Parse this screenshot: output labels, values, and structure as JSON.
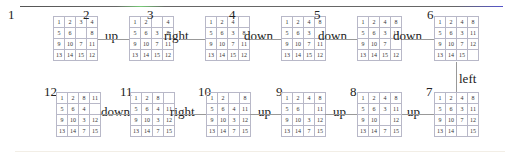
{
  "states": [
    {
      "id": "1",
      "grid": [
        [
          "1",
          "2",
          "3",
          "4"
        ],
        [
          "5",
          "6",
          "",
          "8"
        ],
        [
          "9",
          "10",
          "7",
          "11"
        ],
        [
          "13",
          "14",
          "15",
          "12"
        ]
      ]
    },
    {
      "id": "2",
      "grid": [
        [
          "1",
          "2",
          "",
          "4"
        ],
        [
          "5",
          "6",
          "3",
          "8"
        ],
        [
          "9",
          "10",
          "7",
          "11"
        ],
        [
          "13",
          "14",
          "15",
          "12"
        ]
      ]
    },
    {
      "id": "3",
      "grid": [
        [
          "1",
          "2",
          "4",
          ""
        ],
        [
          "5",
          "6",
          "3",
          "8"
        ],
        [
          "9",
          "10",
          "7",
          "11"
        ],
        [
          "13",
          "14",
          "15",
          "12"
        ]
      ]
    },
    {
      "id": "4",
      "grid": [
        [
          "1",
          "2",
          "4",
          "8"
        ],
        [
          "5",
          "6",
          "3",
          ""
        ],
        [
          "9",
          "10",
          "7",
          "11"
        ],
        [
          "13",
          "14",
          "15",
          "12"
        ]
      ]
    },
    {
      "id": "5",
      "grid": [
        [
          "1",
          "2",
          "4",
          "8"
        ],
        [
          "5",
          "6",
          "3",
          "11"
        ],
        [
          "9",
          "10",
          "7",
          ""
        ],
        [
          "13",
          "14",
          "15",
          "12"
        ]
      ]
    },
    {
      "id": "6",
      "grid": [
        [
          "1",
          "2",
          "4",
          "8"
        ],
        [
          "5",
          "6",
          "3",
          "11"
        ],
        [
          "9",
          "10",
          "7",
          "12"
        ],
        [
          "13",
          "14",
          "15",
          ""
        ]
      ]
    },
    {
      "id": "7",
      "grid": [
        [
          "1",
          "2",
          "4",
          "8"
        ],
        [
          "5",
          "6",
          "3",
          "11"
        ],
        [
          "9",
          "10",
          "7",
          "12"
        ],
        [
          "13",
          "14",
          "",
          "15"
        ]
      ]
    },
    {
      "id": "8",
      "grid": [
        [
          "1",
          "2",
          "4",
          "8"
        ],
        [
          "5",
          "6",
          "3",
          "11"
        ],
        [
          "9",
          "10",
          "",
          "12"
        ],
        [
          "13",
          "14",
          "7",
          "15"
        ]
      ]
    },
    {
      "id": "9",
      "grid": [
        [
          "1",
          "2",
          "4",
          "8"
        ],
        [
          "5",
          "6",
          "",
          "11"
        ],
        [
          "9",
          "10",
          "3",
          "12"
        ],
        [
          "13",
          "14",
          "7",
          "15"
        ]
      ]
    },
    {
      "id": "10",
      "grid": [
        [
          "1",
          "2",
          "",
          "8"
        ],
        [
          "5",
          "6",
          "4",
          "11"
        ],
        [
          "9",
          "10",
          "3",
          "12"
        ],
        [
          "13",
          "14",
          "7",
          "15"
        ]
      ]
    },
    {
      "id": "11",
      "grid": [
        [
          "1",
          "2",
          "8",
          ""
        ],
        [
          "5",
          "6",
          "4",
          "11"
        ],
        [
          "9",
          "10",
          "3",
          "12"
        ],
        [
          "13",
          "14",
          "7",
          "15"
        ]
      ]
    },
    {
      "id": "12",
      "grid": [
        [
          "1",
          "2",
          "8",
          "11"
        ],
        [
          "5",
          "6",
          "4",
          ""
        ],
        [
          "9",
          "10",
          "3",
          "12"
        ],
        [
          "13",
          "14",
          "7",
          "15"
        ]
      ]
    }
  ],
  "moves": [
    {
      "from": "1",
      "to": "2",
      "label": "up"
    },
    {
      "from": "2",
      "to": "3",
      "label": "right"
    },
    {
      "from": "3",
      "to": "4",
      "label": "down"
    },
    {
      "from": "4",
      "to": "5",
      "label": "down"
    },
    {
      "from": "5",
      "to": "6",
      "label": "down"
    },
    {
      "from": "6",
      "to": "7",
      "label": "left"
    },
    {
      "from": "7",
      "to": "8",
      "label": "up"
    },
    {
      "from": "8",
      "to": "9",
      "label": "up"
    },
    {
      "from": "9",
      "to": "10",
      "label": "up"
    },
    {
      "from": "10",
      "to": "11",
      "label": "right"
    },
    {
      "from": "11",
      "to": "12",
      "label": "down"
    }
  ]
}
